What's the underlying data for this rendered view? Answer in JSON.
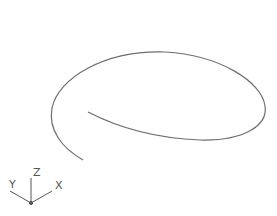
{
  "viewport": {
    "background": "#ffffff",
    "curve_color": "#6e6e6e"
  },
  "drawing": {
    "entity": "spiral-curve"
  },
  "ucs_icon": {
    "x_label": "X",
    "y_label": "Y",
    "z_label": "Z",
    "color": "#555555"
  }
}
